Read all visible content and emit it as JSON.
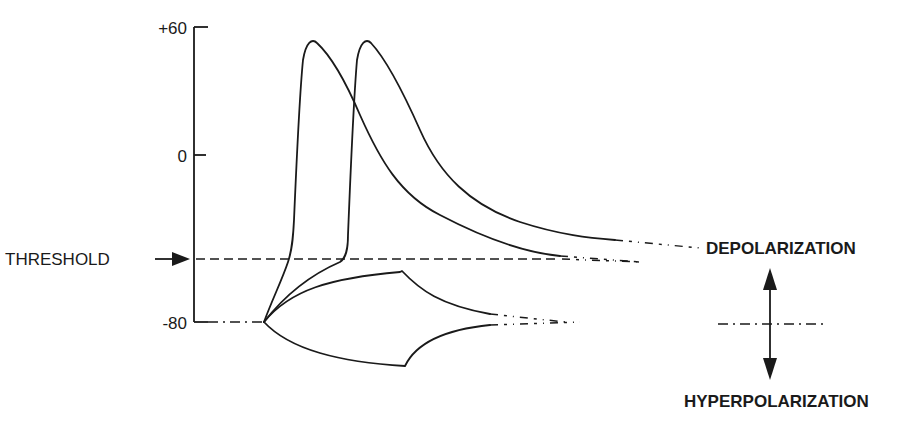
{
  "figure": {
    "y_axis": {
      "ticks": [
        {
          "label": "+60",
          "value": 60
        },
        {
          "label": "0",
          "value": 0
        },
        {
          "label": "-80",
          "value": -80
        }
      ]
    },
    "threshold_label": "THRESHOLD",
    "depolarization_label": "DEPOLARIZATION",
    "hyperpolarization_label": "HYPERPOLARIZATION"
  },
  "colors": {
    "ink": "#1a1a1a",
    "background": "#ffffff"
  }
}
